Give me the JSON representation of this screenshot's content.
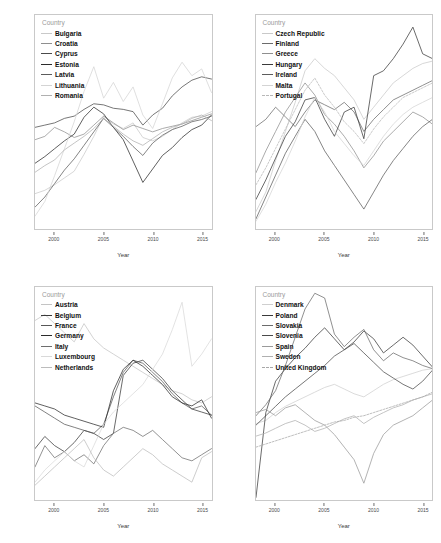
{
  "figure": {
    "title": "",
    "legend_title": "Country",
    "axis_x_label": "Year",
    "axis_y_label": "%",
    "background": "#ffffff",
    "panel_border": "#c9c9c9"
  },
  "chart_data": [
    {
      "id": "panel-eastern-south",
      "type": "line",
      "title": "",
      "xlabel": "Year",
      "ylabel": "%",
      "legend_title": "Country",
      "legend_position": "top-left",
      "grid": false,
      "xlim": [
        1998,
        2016
      ],
      "ylim": [
        17.0,
        36.0
      ],
      "xticks": [
        2000,
        2005,
        2010,
        2015
      ],
      "yticks": [
        20,
        25,
        30,
        35
      ],
      "x": [
        1998,
        1999,
        2000,
        2001,
        2002,
        2003,
        2004,
        2005,
        2006,
        2007,
        2008,
        2009,
        2010,
        2011,
        2012,
        2013,
        2014,
        2015,
        2016
      ],
      "series": [
        {
          "name": "Bulgaria",
          "color": "#c9c9c9",
          "dash": "none",
          "values": [
            20.1,
            20.4,
            20.9,
            21.5,
            22.1,
            23.6,
            25.2,
            27.0,
            26.3,
            25.9,
            26.4,
            25.1,
            24.8,
            25.2,
            25.8,
            26.4,
            26.9,
            27.0,
            27.4
          ]
        },
        {
          "name": "Croatia",
          "color": "#8f8f8f",
          "dash": "none",
          "values": [
            24.9,
            25.2,
            26.0,
            25.6,
            25.1,
            25.4,
            26.2,
            27.0,
            26.4,
            25.8,
            26.2,
            25.9,
            25.6,
            25.9,
            26.1,
            26.3,
            26.6,
            26.9,
            27.2
          ]
        },
        {
          "name": "Cyprus",
          "color": "#4a4a4a",
          "dash": "none",
          "values": [
            26.0,
            26.2,
            26.4,
            26.8,
            27.0,
            27.6,
            28.1,
            28.0,
            27.7,
            27.6,
            27.4,
            26.2,
            27.1,
            27.7,
            28.8,
            29.6,
            30.2,
            30.5,
            30.3
          ]
        },
        {
          "name": "Estonia",
          "color": "#2b2b2b",
          "dash": "none",
          "values": [
            22.8,
            23.4,
            24.1,
            24.8,
            25.4,
            26.9,
            27.8,
            27.2,
            26.0,
            24.9,
            23.0,
            21.1,
            22.3,
            23.5,
            24.2,
            25.1,
            25.8,
            26.2,
            27.1
          ]
        },
        {
          "name": "Latvia",
          "color": "#5c5c5c",
          "dash": "none",
          "values": [
            18.9,
            19.8,
            21.0,
            22.2,
            23.2,
            24.4,
            25.6,
            26.8,
            26.0,
            25.2,
            24.3,
            23.5,
            24.6,
            25.3,
            25.8,
            26.1,
            26.5,
            26.7,
            27.0
          ]
        },
        {
          "name": "Lithuania",
          "color": "#d4d4d4",
          "dash": "none",
          "values": [
            18.1,
            19.4,
            21.7,
            24.1,
            26.5,
            29.2,
            31.4,
            28.6,
            30.0,
            28.3,
            29.6,
            27.1,
            25.9,
            28.1,
            30.4,
            31.8,
            30.6,
            31.2,
            29.1
          ]
        },
        {
          "name": "Romania",
          "color": "#b0b0b0",
          "dash": "none",
          "values": [
            22.0,
            22.6,
            23.1,
            24.0,
            24.6,
            25.2,
            25.9,
            26.8,
            26.1,
            25.4,
            24.8,
            24.4,
            25.0,
            25.6,
            26.0,
            26.3,
            26.8,
            27.1,
            26.6
          ]
        }
      ]
    },
    {
      "id": "panel-czech-portugal",
      "type": "line",
      "title": "",
      "xlabel": "Year",
      "ylabel": "%",
      "legend_title": "Country",
      "legend_position": "top-left",
      "grid": false,
      "xlim": [
        1998,
        2016
      ],
      "ylim": [
        16.6,
        25.4
      ],
      "xticks": [
        2000,
        2005,
        2010,
        2015
      ],
      "yticks": [
        17,
        19,
        21,
        23,
        25
      ],
      "x": [
        1998,
        1999,
        2000,
        2001,
        2002,
        2003,
        2004,
        2005,
        2006,
        2007,
        2008,
        2009,
        2010,
        2011,
        2012,
        2013,
        2014,
        2015,
        2016
      ],
      "series": [
        {
          "name": "Czech Republic",
          "color": "#c9c9c9",
          "dash": "none",
          "values": [
            17.3,
            18.1,
            19.4,
            20.6,
            21.8,
            23.1,
            23.6,
            23.2,
            22.9,
            22.4,
            21.9,
            21.1,
            21.6,
            22.1,
            22.6,
            22.9,
            23.2,
            23.4,
            23.5
          ]
        },
        {
          "name": "Finland",
          "color": "#6b6b6b",
          "dash": "none",
          "values": [
            20.8,
            21.1,
            21.6,
            21.2,
            20.8,
            21.4,
            21.9,
            21.7,
            21.5,
            21.8,
            21.4,
            20.6,
            21.1,
            21.5,
            21.9,
            22.1,
            22.3,
            22.5,
            22.7
          ]
        },
        {
          "name": "Greece",
          "color": "#8f8f8f",
          "dash": "none",
          "values": [
            18.9,
            19.8,
            20.6,
            21.4,
            22.0,
            22.6,
            22.1,
            21.3,
            20.9,
            20.4,
            19.8,
            19.1,
            19.6,
            20.2,
            20.6,
            21.0,
            21.4,
            21.2,
            20.9
          ]
        },
        {
          "name": "Hungary",
          "color": "#3a3a3a",
          "dash": "none",
          "values": [
            17.8,
            18.6,
            19.5,
            20.4,
            21.0,
            21.9,
            22.0,
            21.1,
            20.4,
            21.4,
            21.6,
            20.3,
            22.9,
            23.1,
            23.6,
            24.2,
            24.9,
            23.8,
            23.6
          ]
        },
        {
          "name": "Ireland",
          "color": "#5c5c5c",
          "dash": "none",
          "values": [
            17.0,
            17.9,
            18.8,
            19.7,
            20.4,
            21.1,
            20.6,
            19.8,
            19.2,
            18.6,
            18.0,
            17.4,
            18.1,
            18.8,
            19.4,
            19.9,
            20.4,
            20.8,
            21.1
          ]
        },
        {
          "name": "Malta",
          "color": "#d4d4d4",
          "dash": "none",
          "values": [
            16.9,
            17.6,
            18.5,
            19.3,
            20.2,
            21.2,
            22.0,
            21.4,
            20.6,
            20.1,
            19.6,
            19.2,
            19.8,
            20.4,
            20.9,
            21.3,
            21.6,
            21.8,
            22.0
          ]
        },
        {
          "name": "Portugal",
          "color": "#b8b8b8",
          "dash": "dashed",
          "values": [
            18.4,
            19.1,
            19.9,
            20.7,
            21.5,
            22.3,
            22.8,
            22.1,
            21.6,
            21.0,
            20.6,
            20.1,
            20.7,
            21.2,
            21.6,
            22.0,
            22.2,
            22.4,
            22.6
          ]
        }
      ]
    },
    {
      "id": "panel-western",
      "type": "line",
      "title": "",
      "xlabel": "Year",
      "ylabel": "%",
      "legend_title": "Country",
      "legend_position": "top-left",
      "grid": false,
      "xlim": [
        1998,
        2016
      ],
      "ylim": [
        12.8,
        19.8
      ],
      "xticks": [
        2000,
        2005,
        2010,
        2015
      ],
      "yticks": [
        14,
        16,
        18
      ],
      "x": [
        1998,
        1999,
        2000,
        2001,
        2002,
        2003,
        2004,
        2005,
        2006,
        2007,
        2008,
        2009,
        2010,
        2011,
        2012,
        2013,
        2014,
        2015,
        2016
      ],
      "series": [
        {
          "name": "Austria",
          "color": "#c4c4c4",
          "dash": "none",
          "values": [
            18.7,
            18.9,
            18.6,
            18.3,
            18.0,
            18.6,
            18.1,
            17.8,
            17.6,
            17.4,
            17.2,
            17.0,
            16.8,
            16.6,
            16.4,
            16.3,
            16.1,
            16.0,
            16.2
          ]
        },
        {
          "name": "Belgium",
          "color": "#3a3a3a",
          "dash": "none",
          "values": [
            14.5,
            14.9,
            14.6,
            14.4,
            14.7,
            15.1,
            15.0,
            14.8,
            15.0,
            16.9,
            17.3,
            17.4,
            17.1,
            16.8,
            16.4,
            16.1,
            15.8,
            15.7,
            15.6
          ]
        },
        {
          "name": "France",
          "color": "#575757",
          "dash": "none",
          "values": [
            15.9,
            15.7,
            15.5,
            15.3,
            15.2,
            15.1,
            15.0,
            15.3,
            16.2,
            17.0,
            17.4,
            17.3,
            17.0,
            16.7,
            16.3,
            16.0,
            15.8,
            15.9,
            15.6
          ]
        },
        {
          "name": "Germany",
          "color": "#2b2b2b",
          "dash": "none",
          "values": [
            16.0,
            15.9,
            15.8,
            15.6,
            15.5,
            15.4,
            15.3,
            15.2,
            16.4,
            17.1,
            17.4,
            17.2,
            16.9,
            16.6,
            16.2,
            16.0,
            15.9,
            16.1,
            15.5
          ]
        },
        {
          "name": "Italy",
          "color": "#6e6e6e",
          "dash": "none",
          "values": [
            13.9,
            14.6,
            14.2,
            14.4,
            14.1,
            14.3,
            14.0,
            14.6,
            15.0,
            15.2,
            15.1,
            14.9,
            15.1,
            14.8,
            14.5,
            14.2,
            14.1,
            14.3,
            14.5
          ]
        },
        {
          "name": "Luxembourg",
          "color": "#d9d9d9",
          "dash": "none",
          "values": [
            13.4,
            13.8,
            14.1,
            14.4,
            14.1,
            13.9,
            14.6,
            15.3,
            15.7,
            16.0,
            16.3,
            16.6,
            17.1,
            17.6,
            18.4,
            19.3,
            17.2,
            17.6,
            18.1
          ]
        },
        {
          "name": "Netherlands",
          "color": "#bcbcbc",
          "dash": "none",
          "values": [
            13.3,
            13.6,
            13.9,
            14.2,
            14.5,
            14.8,
            14.2,
            13.8,
            13.6,
            13.9,
            14.2,
            14.5,
            14.3,
            14.0,
            13.8,
            13.6,
            13.4,
            14.2,
            14.4
          ]
        }
      ]
    },
    {
      "id": "panel-north-central",
      "type": "line",
      "title": "",
      "xlabel": "Year",
      "ylabel": "%",
      "legend_title": "Country",
      "legend_position": "top-left",
      "grid": false,
      "xlim": [
        1998,
        2016
      ],
      "ylim": [
        12.0,
        25.6
      ],
      "xticks": [
        2000,
        2005,
        2010,
        2015
      ],
      "yticks": [
        12.5,
        15.0,
        17.5,
        20.0,
        22.5,
        25.0
      ],
      "ytick_labels": [
        "12.5",
        "15.0",
        "17.5",
        "20.0",
        "22.5",
        "25.0"
      ],
      "x": [
        1998,
        1999,
        2000,
        2001,
        2002,
        2003,
        2004,
        2005,
        2006,
        2007,
        2008,
        2009,
        2010,
        2011,
        2012,
        2013,
        2014,
        2015,
        2016
      ],
      "series": [
        {
          "name": "Denmark",
          "color": "#cfcfcf",
          "dash": "none",
          "values": [
            16.9,
            17.1,
            17.6,
            18.0,
            18.3,
            18.6,
            18.9,
            19.2,
            19.4,
            19.1,
            18.8,
            18.6,
            19.0,
            19.4,
            19.7,
            19.9,
            20.1,
            20.3,
            20.4
          ]
        },
        {
          "name": "Poland",
          "color": "#3a3a3a",
          "dash": "none",
          "values": [
            12.2,
            17.6,
            19.6,
            20.4,
            21.1,
            21.7,
            22.4,
            23.0,
            22.3,
            21.6,
            22.1,
            22.8,
            22.3,
            21.4,
            21.9,
            22.4,
            21.9,
            21.2,
            20.5
          ]
        },
        {
          "name": "Slovakia",
          "color": "#6b6b6b",
          "dash": "none",
          "values": [
            17.4,
            18.1,
            19.0,
            20.6,
            22.4,
            24.2,
            25.2,
            24.9,
            22.6,
            21.8,
            22.4,
            22.9,
            21.6,
            20.9,
            21.4,
            21.1,
            20.9,
            20.6,
            20.4
          ]
        },
        {
          "name": "Slovenia",
          "color": "#4a4a4a",
          "dash": "none",
          "values": [
            16.8,
            17.4,
            18.0,
            18.6,
            19.1,
            19.6,
            20.1,
            20.6,
            21.2,
            21.6,
            22.0,
            21.4,
            20.8,
            20.2,
            19.8,
            19.4,
            19.1,
            19.6,
            20.3
          ]
        },
        {
          "name": "Spain",
          "color": "#9a9a9a",
          "dash": "none",
          "values": [
            17.6,
            17.8,
            17.4,
            17.9,
            18.1,
            17.6,
            17.1,
            16.8,
            16.2,
            15.4,
            14.6,
            13.1,
            15.0,
            16.2,
            16.8,
            17.1,
            17.4,
            17.9,
            18.4
          ]
        },
        {
          "name": "Sweden",
          "color": "#b0b0b0",
          "dash": "none",
          "values": [
            16.1,
            16.3,
            16.6,
            16.9,
            17.1,
            16.8,
            16.4,
            16.6,
            16.9,
            17.2,
            17.4,
            16.9,
            17.3,
            17.6,
            17.9,
            18.1,
            18.4,
            18.6,
            18.8
          ]
        },
        {
          "name": "United Kingdom",
          "color": "#a8a8a8",
          "dash": "dashed",
          "values": [
            15.4,
            15.6,
            15.8,
            16.0,
            16.2,
            16.4,
            16.6,
            16.8,
            17.0,
            17.1,
            17.3,
            17.4,
            17.6,
            17.8,
            18.0,
            18.2,
            18.4,
            18.6,
            18.9
          ]
        }
      ]
    }
  ]
}
